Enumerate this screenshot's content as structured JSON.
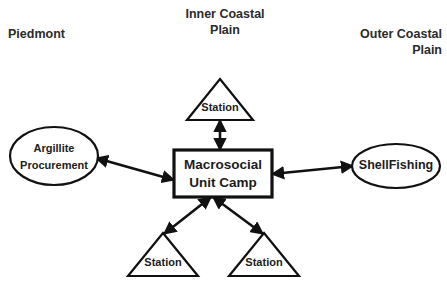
{
  "diagram": {
    "background_color": "#ffffff",
    "stroke_color": "#111111",
    "text_color": "#1c1c1c",
    "region_labels": [
      {
        "id": "piedmont",
        "text": "Piedmont"
      },
      {
        "id": "inner-coastal-plain",
        "text": "Inner Coastal\nPlain"
      },
      {
        "id": "outer-coastal-plain",
        "text": "Outer Coastal\nPlain"
      }
    ],
    "nodes": {
      "center_box": {
        "shape": "rectangle",
        "line1": "Macrosocial",
        "line2": "Unit Camp"
      },
      "left_ellipse": {
        "shape": "ellipse",
        "line1": "Argillite",
        "line2": "Procurement"
      },
      "right_ellipse": {
        "shape": "ellipse",
        "line1": "ShellFishing"
      },
      "top_triangle": {
        "shape": "triangle",
        "line1": "Station"
      },
      "bottom_left_triangle": {
        "shape": "triangle",
        "line1": "Station"
      },
      "bottom_right_triangle": {
        "shape": "triangle",
        "line1": "Station"
      }
    },
    "connectors": [
      {
        "id": "top",
        "from": "center_box",
        "to": "top_triangle",
        "style": "double-headed-arrow"
      },
      {
        "id": "left",
        "from": "center_box",
        "to": "left_ellipse",
        "style": "double-headed-arrow"
      },
      {
        "id": "right",
        "from": "center_box",
        "to": "right_ellipse",
        "style": "double-headed-arrow"
      },
      {
        "id": "bottom-left",
        "from": "center_box",
        "to": "bottom_left_triangle",
        "style": "double-headed-arrow"
      },
      {
        "id": "bottom-right",
        "from": "center_box",
        "to": "bottom_right_triangle",
        "style": "double-headed-arrow"
      }
    ]
  }
}
